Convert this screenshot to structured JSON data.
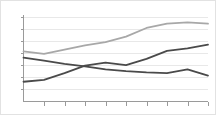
{
  "chart_data": {
    "type": "line",
    "title": "",
    "subtitle": "",
    "xlabel": "",
    "ylabel": "",
    "xlim": [
      0,
      9
    ],
    "ylim": [
      0,
      7
    ],
    "grid": true,
    "legend_position": "none",
    "x": [
      0,
      1,
      2,
      3,
      4,
      5,
      6,
      7,
      8,
      9
    ],
    "xtick_labels": [
      "",
      "",
      "",
      "",
      "",
      "",
      "",
      "",
      "",
      ""
    ],
    "ytick_labels": [
      "",
      "",
      "",
      "",
      "",
      "",
      ""
    ],
    "series": [
      {
        "name": "series-light",
        "color": "#a8a8a8",
        "width": 1.8,
        "values": [
          4.05,
          3.85,
          4.2,
          4.55,
          4.8,
          5.25,
          5.95,
          6.3,
          6.4,
          6.3
        ]
      },
      {
        "name": "series-dark-declining",
        "color": "#4a4a4a",
        "width": 1.8,
        "values": [
          3.55,
          3.3,
          3.05,
          2.85,
          2.6,
          2.45,
          2.35,
          2.3,
          2.6,
          2.1
        ]
      },
      {
        "name": "series-dark-rising",
        "color": "#4a4a4a",
        "width": 1.8,
        "values": [
          1.6,
          1.75,
          2.3,
          2.9,
          3.15,
          2.95,
          3.45,
          4.1,
          4.3,
          4.6
        ]
      }
    ],
    "axes": {
      "x_axis_color": "#9a9a9a",
      "y_axis_color": "#9a9a9a",
      "gridline_color": "#e8e8e8",
      "background": "#ffffff",
      "border_color": "#e2e2e2"
    }
  }
}
